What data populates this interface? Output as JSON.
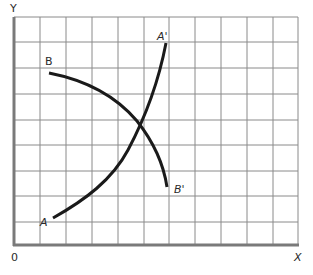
{
  "diagram": {
    "type": "two-curve graph on grid",
    "axes": {
      "y_label": "Y",
      "x_label": "X",
      "origin_label": "0"
    },
    "grid": {
      "columns": 11,
      "rows": 9,
      "left": 14,
      "top": 17,
      "right": 298,
      "bottom": 245,
      "line_color": "#8a8a8a",
      "axis_color": "#7a7a7a"
    },
    "curves": [
      {
        "name": "AA'",
        "start_label": "A",
        "end_label": "A'",
        "shape": "upward-sloping, convex (increasing slope)",
        "color": "#1a1a1a",
        "path": "M53,218 C85,200 112,180 128,150 C145,118 158,85 166,43"
      },
      {
        "name": "BB'",
        "start_label": "B",
        "end_label": "B'",
        "shape": "downward-sloping, concave",
        "color": "#1a1a1a",
        "path": "M49,73 C85,80 115,95 137,121 C152,140 163,160 167,187"
      }
    ],
    "intersection": {
      "x": 137,
      "y": 121,
      "note": "curves AA' and BB' cross"
    }
  },
  "labels": {
    "y": "Y",
    "x": "X",
    "origin": "0",
    "a": "A",
    "a_prime": "A'",
    "b": "B",
    "b_prime": "B'"
  }
}
